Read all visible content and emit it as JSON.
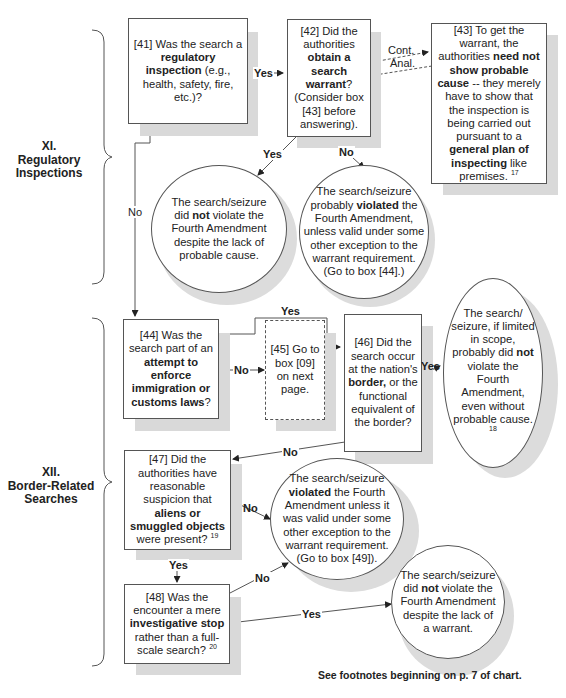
{
  "sections": [
    {
      "id": "XI",
      "numeral": "XI.",
      "title": "Regulatory Inspections"
    },
    {
      "id": "XII",
      "numeral": "XII.",
      "title": "Border-Related Searches"
    }
  ],
  "nodes": {
    "n41": {
      "pre": "[41] Was the search a ",
      "bold": "regulatory inspection",
      "post": " (e.g., health, safety, fire, etc.)?"
    },
    "n42": {
      "pre": "[42] Did the authorities ",
      "bold": "obtain a search warrant",
      "post": "? (Consider box [43] before answering)."
    },
    "n43": {
      "pre": "[43] To get the warrant, the authorities ",
      "bold1": "need not show probable cause",
      "mid": " -- they merely have to show that the inspection is being carried out pursuant to a ",
      "bold2": "general plan of inspecting",
      "post": " like premises.",
      "footnote": "17"
    },
    "r_not_violate_pc": {
      "pre": "The search/seizure did ",
      "bold": "not",
      "post": " violate the Fourth Amendment despite the lack of probable cause."
    },
    "r_prob_violated": {
      "pre": "The search/seizure probably ",
      "bold": "violated",
      "post": " the Fourth Amendment, unless valid under some other exception to the warrant requirement. (Go to box [44].)"
    },
    "n44": {
      "pre": "[44] Was the search part of an ",
      "bold": "attempt to enforce immigration or customs  laws",
      "post": "?"
    },
    "n45": {
      "text": "[45] Go to box [09] on next page."
    },
    "n46": {
      "pre": "[46] Did the search occur at the nation's ",
      "bold": "border,",
      "post": " or the functional equivalent of the border?"
    },
    "r_border_ok": {
      "pre": "The search/ seizure, if limited in scope, probably did ",
      "bold": "not",
      "post": " violate the Fourth Amendment, even without probable cause.",
      "footnote": "18"
    },
    "n47": {
      "pre": "[47] Did the authorities have reasonable suspicion that ",
      "bold": "aliens or smuggled objects",
      "post": " were present?",
      "footnote": "19"
    },
    "r_violated": {
      "pre": "The search/seizure ",
      "bold": "violated",
      "post": " the Fourth Amendment unless it was valid under some other exception to the warrant requirement. (Go to box [49])."
    },
    "n48": {
      "pre": "[48] Was the encounter a mere ",
      "bold": "investigative stop",
      "post": " rather than a full-scale search?",
      "footnote": "20"
    },
    "r_not_violate_w": {
      "pre": "The search/seizure did ",
      "bold": "not",
      "post": " violate the Fourth Amendment despite the lack of a warrant."
    }
  },
  "edges": {
    "e41_42": "Yes",
    "e41_44": "No",
    "e42_cont": "Cont.",
    "e42_anal": "Anal.",
    "e42_yes": "Yes",
    "e42_no": "No",
    "e44_45": "No",
    "e44_46": "Yes",
    "e46_yes": "Yes",
    "e46_no": "No",
    "e47_no": "No",
    "e47_yes": "Yes",
    "e48_no": "No",
    "e48_yes": "Yes"
  },
  "footer": "See footnotes beginning on p. 7 of chart."
}
